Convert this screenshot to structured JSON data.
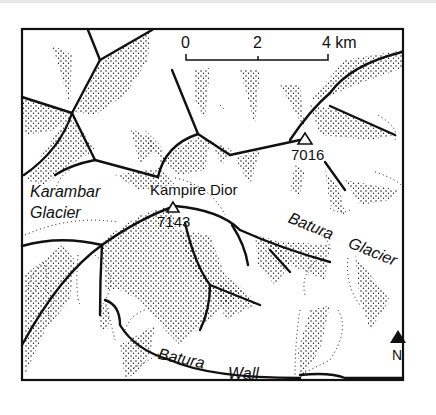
{
  "map": {
    "scale_bar": {
      "ticks": [
        "0",
        "2",
        "4 km"
      ]
    },
    "peaks": [
      {
        "name": "Kampire Dior",
        "elevation": "7143"
      },
      {
        "name": "",
        "elevation": "7016"
      }
    ],
    "labels": {
      "karambar_line1": "Karambar",
      "karambar_line2": "Glacier",
      "kampire_dior": "Kampire Dior",
      "batura_glacier_1": "Batura",
      "batura_glacier_2": "Glacier",
      "batura_wall_1": "Batura",
      "batura_wall_2": "Wall"
    },
    "north_arrow": {
      "label": "N"
    },
    "colors": {
      "ink": "#111111",
      "paper": "#ffffff"
    }
  }
}
